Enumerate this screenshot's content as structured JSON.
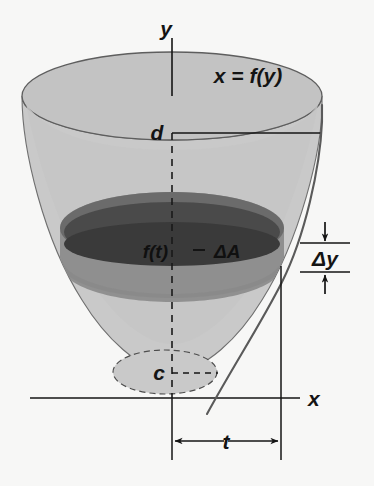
{
  "figure": {
    "title_alt": "Volume of a solid of revolution about the y-axis",
    "background_color": "#f7f7f6",
    "labels": {
      "y_axis": "y",
      "x_axis": "x",
      "curve": "x = f(y)",
      "upper_limit": "d",
      "lower_limit": "c",
      "radius": "f(t)",
      "cross_section_area": "ΔA",
      "thickness": "Δy",
      "sample_point": "t"
    },
    "colors": {
      "solid_light": "#c9c9c9",
      "solid_light_top": "#bfbfbf",
      "slab_mid": "#8d8d8d",
      "slab_dark": "#4a4a4a",
      "outline": "#6b6b6b",
      "ink": "#141414"
    },
    "geometry": {
      "top_ellipse_center": [
        172,
        96
      ],
      "top_ellipse_radii": [
        150,
        44
      ],
      "bottom_ellipse_center": [
        165,
        372
      ],
      "bottom_ellipse_radii": [
        52,
        22
      ],
      "slab_top_center": [
        172,
        228
      ],
      "slab_top_radii": [
        112,
        36
      ],
      "slab_bottom_center": [
        172,
        262
      ],
      "slab_bottom_radii": [
        104,
        34
      ],
      "y_axis_x": 172,
      "x_axis_y": 398,
      "right_guide_x": 281,
      "delta_y_top": 243,
      "delta_y_bottom": 272
    }
  }
}
